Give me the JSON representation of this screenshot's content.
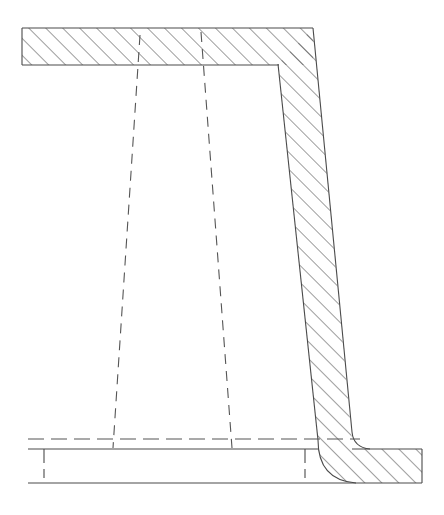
{
  "document": {
    "type": "engineering-cross-section-drawing",
    "title": "",
    "width": 444,
    "height": 515,
    "background_color": "#ffffff",
    "line_color": "#4a4a4a",
    "hatch_color": "#6b6b6b"
  },
  "styles": {
    "solid_stroke_width": 1.1,
    "hatch_stroke_width": 0.85,
    "hatch_angle_degrees": 45,
    "hatch_spacing_px": 12,
    "dashed_pattern": "10 7",
    "dash_dot_pattern": "16 6 16 6",
    "thin_stroke_width": 1.0
  },
  "geometry": {
    "top_flange": {
      "name": "top-horizontal-bar",
      "hatched": true,
      "points": "22,28 313,28 313,65 22,65",
      "left_x": 22,
      "right_x": 313,
      "top_y": 28,
      "bottom_y": 65
    },
    "vertical_web": {
      "name": "tapered-vertical-column",
      "hatched": true,
      "outline": "278,64 313,28 355,440 318,440",
      "top_left_x": 278,
      "top_right_x": 313,
      "bottom_left_x": 318,
      "bottom_right_x": 352,
      "top_y": 64,
      "bottom_y": 440
    },
    "bottom_flange": {
      "name": "bottom-horizontal-flange",
      "hatched_right_portion": true,
      "left_x": 28,
      "right_x": 422,
      "top_y": 449,
      "bottom_y": 483,
      "hatch_start_x": 318
    },
    "fillet": {
      "name": "fillet-radius-arc",
      "start_x": 318,
      "start_y": 440,
      "end_x": 352,
      "end_y": 483,
      "radius": 44
    },
    "fillet_right": {
      "name": "fillet-radius-arc-right",
      "start_x": 352,
      "start_y": 440,
      "end_x": 368,
      "end_y": 452,
      "radius": 16
    },
    "hidden_lines": [
      {
        "name": "hidden-edge-left",
        "x1": 140,
        "y1": 35,
        "x2": 113,
        "y2": 448
      },
      {
        "name": "hidden-edge-right",
        "x1": 201,
        "y1": 32,
        "x2": 232,
        "y2": 448
      }
    ],
    "center_line": {
      "name": "horizontal-center-line",
      "x1": 28,
      "y1": 439,
      "x2": 360,
      "y2": 439
    },
    "left_tick": {
      "name": "left-edge-tick-mark",
      "x": 44,
      "y1": 449,
      "y2": 478
    },
    "web_base_tick": {
      "name": "web-base-tick-mark",
      "x": 305,
      "y1": 449,
      "y2": 478
    }
  },
  "annotations": {
    "visible_text": [],
    "dimensions": [],
    "labels": []
  }
}
